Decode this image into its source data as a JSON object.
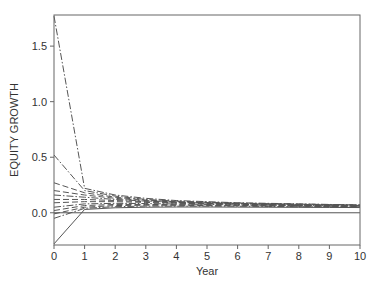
{
  "chart_data": {
    "type": "line",
    "title": "",
    "xlabel": "Year",
    "ylabel": "EQUITY GROWTH",
    "xlim": [
      0,
      10
    ],
    "ylim": [
      -0.29,
      1.78
    ],
    "grid": false,
    "legend": null,
    "x_ticks": [
      0,
      1,
      2,
      3,
      4,
      5,
      6,
      7,
      8,
      9,
      10
    ],
    "x_tick_labels": [
      "0",
      "1",
      "2",
      "3",
      "4",
      "5",
      "6",
      "7",
      "8",
      "9",
      "10"
    ],
    "y_ticks": [
      0.0,
      0.5,
      1.0,
      1.5
    ],
    "y_tick_labels": [
      "0.0",
      "0.5",
      "1.0",
      "1.5"
    ],
    "reference_line": {
      "y": 0.0,
      "style": "solid"
    },
    "x": [
      0,
      1,
      2,
      3,
      4,
      5,
      6,
      7,
      8,
      9,
      10
    ],
    "series": [
      {
        "name": "s1",
        "style": "dashdot",
        "values": [
          1.77,
          0.22,
          0.16,
          0.13,
          0.11,
          0.1,
          0.09,
          0.085,
          0.08,
          0.075,
          0.07
        ]
      },
      {
        "name": "s2",
        "style": "dashdot",
        "values": [
          0.52,
          0.2,
          0.15,
          0.12,
          0.105,
          0.095,
          0.088,
          0.082,
          0.078,
          0.074,
          0.07
        ]
      },
      {
        "name": "s3",
        "style": "dashed",
        "values": [
          0.27,
          0.18,
          0.14,
          0.115,
          0.1,
          0.092,
          0.085,
          0.08,
          0.076,
          0.072,
          0.068
        ]
      },
      {
        "name": "s4",
        "style": "dashed",
        "values": [
          0.2,
          0.16,
          0.13,
          0.11,
          0.097,
          0.089,
          0.083,
          0.078,
          0.074,
          0.07,
          0.067
        ]
      },
      {
        "name": "s5",
        "style": "dashdot",
        "values": [
          0.16,
          0.14,
          0.12,
          0.105,
          0.094,
          0.087,
          0.081,
          0.076,
          0.072,
          0.069,
          0.066
        ]
      },
      {
        "name": "s6",
        "style": "dashed",
        "values": [
          0.12,
          0.12,
          0.11,
          0.1,
          0.09,
          0.084,
          0.079,
          0.074,
          0.07,
          0.067,
          0.064
        ]
      },
      {
        "name": "s7",
        "style": "dashed",
        "values": [
          0.09,
          0.1,
          0.1,
          0.093,
          0.086,
          0.08,
          0.076,
          0.072,
          0.068,
          0.065,
          0.062
        ]
      },
      {
        "name": "s8",
        "style": "dashdot",
        "values": [
          0.05,
          0.08,
          0.085,
          0.083,
          0.079,
          0.075,
          0.071,
          0.068,
          0.065,
          0.062,
          0.06
        ]
      },
      {
        "name": "s9",
        "style": "dashed",
        "values": [
          0.02,
          0.065,
          0.075,
          0.075,
          0.073,
          0.07,
          0.067,
          0.064,
          0.062,
          0.06,
          0.058
        ]
      },
      {
        "name": "s10",
        "style": "dashed",
        "values": [
          -0.01,
          0.05,
          0.065,
          0.068,
          0.067,
          0.065,
          0.063,
          0.061,
          0.059,
          0.057,
          0.055
        ]
      },
      {
        "name": "s11",
        "style": "dashdot",
        "values": [
          -0.05,
          0.04,
          0.055,
          0.06,
          0.06,
          0.06,
          0.059,
          0.057,
          0.055,
          0.054,
          0.052
        ]
      },
      {
        "name": "s12",
        "style": "solid",
        "values": [
          -0.28,
          0.03,
          0.045,
          0.05,
          0.052,
          0.052,
          0.051,
          0.05,
          0.049,
          0.048,
          0.047
        ]
      }
    ]
  }
}
